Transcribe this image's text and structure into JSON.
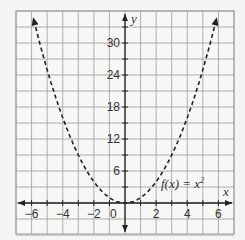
{
  "chart_data": {
    "type": "line",
    "title": "",
    "function_label": "f(x) = x²",
    "xlabel": "x",
    "ylabel": "y",
    "xlim": [
      -7,
      7
    ],
    "ylim": [
      -6,
      36
    ],
    "grid": true,
    "x_ticks": [
      -6,
      -4,
      -2,
      0,
      2,
      4,
      6
    ],
    "y_ticks": [
      6,
      12,
      18,
      24,
      30
    ],
    "series": [
      {
        "name": "f(x) = x^2",
        "style": "dashed",
        "arrows": "both-ends",
        "x": [
          -6,
          -5,
          -4,
          -3,
          -2,
          -1,
          0,
          1,
          2,
          3,
          4,
          5,
          6
        ],
        "y": [
          36,
          25,
          16,
          9,
          4,
          1,
          0,
          1,
          4,
          9,
          16,
          25,
          36
        ]
      }
    ]
  },
  "labels": {
    "x_axis": "x",
    "y_axis": "y",
    "curve": "f(x) = x",
    "curve_exp": "2",
    "origin": "0",
    "x_ticks": [
      "−6",
      "−4",
      "−2",
      "2",
      "4",
      "6"
    ],
    "y_ticks": [
      "6",
      "12",
      "18",
      "24",
      "30"
    ]
  },
  "colors": {
    "grid": "#9a9a9a",
    "axis": "#222222",
    "curve": "#222222",
    "background": "#f4f4f2"
  }
}
